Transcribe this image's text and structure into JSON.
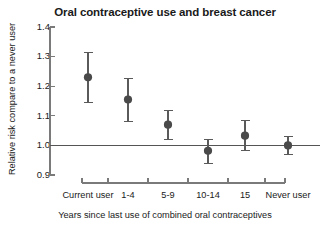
{
  "chart_data": {
    "type": "scatter",
    "title": "Oral contraceptive use and breast cancer",
    "xlabel": "Years since last use of combined oral contraceptives",
    "ylabel": "Relative risk compare to a never user",
    "ylim": [
      0.9,
      1.4
    ],
    "yticks": [
      "1.4",
      "1.3",
      "1.2",
      "1.1",
      "1.0",
      "0.9"
    ],
    "ytick_values": [
      1.4,
      1.3,
      1.2,
      1.1,
      1.0,
      0.9
    ],
    "grid": false,
    "legend": "none",
    "reference_line": 1.0,
    "categories": [
      "Current user",
      "1-4",
      "5-9",
      "10-14",
      "15",
      "Never user"
    ],
    "values": [
      1.23,
      1.155,
      1.07,
      0.982,
      1.033,
      1.0
    ],
    "ci_lower": [
      1.145,
      1.082,
      1.02,
      0.938,
      0.982,
      0.97
    ],
    "ci_upper": [
      1.315,
      1.225,
      1.118,
      1.021,
      1.085,
      1.03
    ],
    "marker_color": "#4a4a4a",
    "axis_color": "#7a7a7a",
    "error_bar_color": "#5a5a5a"
  }
}
